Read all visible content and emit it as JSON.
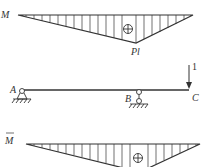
{
  "diagram": {
    "moment_diagram": {
      "label": "M",
      "peak_label": "Pl",
      "sign": "⊕"
    },
    "beam": {
      "points": [
        "A",
        "B",
        "C"
      ],
      "load_label": "1"
    },
    "unit_moment_diagram": {
      "label": "M",
      "label_overline": true,
      "sign": "⊕"
    },
    "colors": {
      "stroke": "#333333",
      "background": "#ffffff"
    }
  }
}
